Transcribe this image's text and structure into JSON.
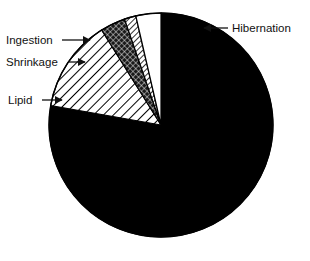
{
  "chart_data": {
    "type": "pie",
    "title": "",
    "subtitle": "",
    "xlabel": "",
    "ylabel": "",
    "grid": false,
    "legend_position": "none",
    "labels_placement": "leader-line callouts",
    "start_angle_deg": 0,
    "direction": "clockwise",
    "center": {
      "x": 161,
      "y": 125
    },
    "radius": 112,
    "categories": [
      "Hibernation",
      "Lipid",
      "Shrinkage",
      "Ingestion",
      "Unlabeled"
    ],
    "values": [
      78,
      15,
      4,
      2,
      1
    ],
    "slices": [
      {
        "name": "Hibernation",
        "label": "Hibernation",
        "percent": 78,
        "start_angle_deg": 0,
        "end_angle_deg": 280,
        "fill_style": "solid-black",
        "color": "#000000"
      },
      {
        "name": "Lipid",
        "label": "Lipid",
        "percent": 15,
        "start_angle_deg": 280,
        "end_angle_deg": 328,
        "fill_style": "diagonal-hatch",
        "color": "#ffffff"
      },
      {
        "name": "Shrinkage",
        "label": "Shrinkage",
        "percent": 4,
        "start_angle_deg": 328,
        "end_angle_deg": 341,
        "fill_style": "dense-crosshatch",
        "color": "#2a2a2a"
      },
      {
        "name": "Ingestion",
        "label": "Ingestion",
        "percent": 2,
        "start_angle_deg": 341,
        "end_angle_deg": 347,
        "fill_style": "fine-diagonal-hatch",
        "color": "#ffffff"
      },
      {
        "name": "Unlabeled",
        "label": "",
        "percent": 1,
        "start_angle_deg": 347,
        "end_angle_deg": 360,
        "fill_style": "blank-white",
        "color": "#ffffff"
      }
    ]
  },
  "callouts": [
    {
      "name": "hibernation",
      "label": "Hibernation",
      "text_x": 232,
      "text_y": 32,
      "anchor": "start",
      "arrow_dir": "left",
      "line_x1": 228,
      "line_x2": 204,
      "line_y": 28
    },
    {
      "name": "ingestion",
      "label": "Ingestion",
      "text_x": 6,
      "text_y": 44,
      "anchor": "start",
      "arrow_dir": "right",
      "line_x1": 62,
      "line_x2": 90,
      "line_y": 40
    },
    {
      "name": "shrinkage",
      "label": "Shrinkage",
      "text_x": 6,
      "text_y": 66,
      "anchor": "start",
      "arrow_dir": "right",
      "line_x1": 68,
      "line_x2": 85,
      "line_y": 62
    },
    {
      "name": "lipid",
      "label": "Lipid",
      "text_x": 8,
      "text_y": 104,
      "anchor": "start",
      "arrow_dir": "right",
      "line_x1": 42,
      "line_x2": 62,
      "line_y": 100
    }
  ],
  "colors": {
    "background": "#ffffff",
    "stroke": "#000000",
    "text": "#111111"
  }
}
